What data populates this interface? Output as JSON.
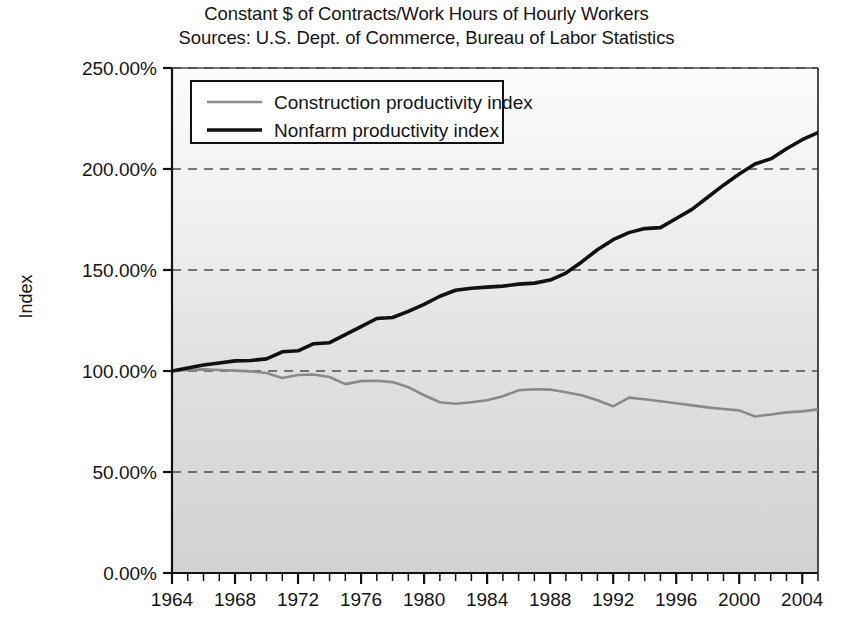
{
  "chart_data": {
    "type": "line",
    "title": "Constant $ of Contracts/Work Hours of Hourly Workers",
    "subtitle": "Sources: U.S. Dept. of Commerce, Bureau of Labor Statistics",
    "xlabel": "",
    "ylabel": "Index",
    "ylim": [
      0,
      250
    ],
    "xlim": [
      1964,
      2005
    ],
    "grid": true,
    "grid_style": "dashed-horizontal",
    "legend_position": "top-left-inside",
    "y_ticks": [
      "0.00%",
      "50.00%",
      "100.00%",
      "150.00%",
      "200.00%",
      "250.00%"
    ],
    "y_tick_values": [
      0,
      50,
      100,
      150,
      200,
      250
    ],
    "x_ticks": [
      "1964",
      "1968",
      "1972",
      "1976",
      "1980",
      "1984",
      "1988",
      "1992",
      "1996",
      "2000",
      "2004"
    ],
    "x_tick_values": [
      1964,
      1968,
      1972,
      1976,
      1980,
      1984,
      1988,
      1992,
      1996,
      2000,
      2004
    ],
    "x_minor_tick_interval": 1,
    "x": [
      1964,
      1965,
      1966,
      1967,
      1968,
      1969,
      1970,
      1971,
      1972,
      1973,
      1974,
      1975,
      1976,
      1977,
      1978,
      1979,
      1980,
      1981,
      1982,
      1983,
      1984,
      1985,
      1986,
      1987,
      1988,
      1989,
      1990,
      1991,
      1992,
      1993,
      1994,
      1995,
      1996,
      1997,
      1998,
      1999,
      2000,
      2001,
      2002,
      2003,
      2004,
      2005
    ],
    "series": [
      {
        "name": "Construction productivity index",
        "color": "#8a8a8a",
        "line_width": 2.6,
        "values": [
          100.0,
          100.5,
          100.8,
          100.5,
          100.2,
          99.8,
          99.0,
          96.5,
          98.0,
          98.3,
          97.0,
          93.5,
          95.0,
          95.2,
          94.5,
          92.0,
          88.0,
          84.5,
          83.8,
          84.5,
          85.5,
          87.5,
          90.5,
          91.0,
          90.8,
          89.5,
          88.0,
          85.5,
          82.5,
          86.8,
          86.0,
          85.0,
          84.0,
          83.0,
          82.0,
          81.2,
          80.5,
          77.5,
          78.5,
          79.5,
          80.0,
          81.0
        ]
      },
      {
        "name": "Nonfarm productivity index",
        "color": "#111111",
        "line_width": 3.6,
        "values": [
          100.0,
          101.5,
          103.0,
          104.0,
          105.0,
          105.2,
          106.0,
          109.5,
          110.0,
          113.5,
          114.0,
          118.0,
          122.0,
          126.0,
          126.5,
          129.5,
          133.0,
          137.0,
          140.0,
          141.0,
          141.5,
          142.0,
          143.0,
          143.5,
          145.0,
          148.5,
          154.0,
          160.0,
          165.0,
          168.5,
          170.5,
          171.0,
          175.5,
          180.0,
          186.0,
          192.0,
          197.5,
          202.5,
          205.0,
          210.0,
          214.5,
          218.0
        ]
      }
    ]
  }
}
